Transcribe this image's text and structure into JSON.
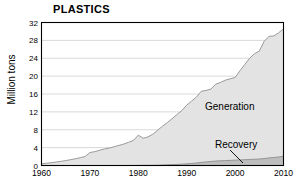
{
  "chart_data": {
    "type": "area",
    "title": "PLASTICS",
    "xlabel": "",
    "ylabel": "Million tons",
    "xlim": [
      1960,
      2010
    ],
    "ylim": [
      0,
      32
    ],
    "ytick_labels": [
      "0",
      "4",
      "8",
      "12",
      "16",
      "20",
      "24",
      "28",
      "32"
    ],
    "ytick_values": [
      0,
      4,
      8,
      12,
      16,
      20,
      24,
      28,
      32
    ],
    "xtick_labels": [
      "1960",
      "1970",
      "1980",
      "1990",
      "2000",
      "2010"
    ],
    "xtick_values": [
      1960,
      1970,
      1980,
      1990,
      2000,
      2010
    ],
    "grid": "horizontal",
    "legend": "inline-annotations",
    "colors": {
      "generation_fill": "#e3e3e3",
      "generation_line": "#9a9a9a",
      "recovery_fill": "#bdbdbd",
      "recovery_line": "#8c8c8c",
      "axis": "#000000",
      "gridline": "#d9d9d9",
      "text": "#000000"
    },
    "x": [
      1960,
      1961,
      1962,
      1963,
      1964,
      1965,
      1966,
      1967,
      1968,
      1969,
      1970,
      1971,
      1972,
      1973,
      1974,
      1975,
      1976,
      1977,
      1978,
      1979,
      1980,
      1981,
      1982,
      1983,
      1984,
      1985,
      1986,
      1987,
      1988,
      1989,
      1990,
      1991,
      1992,
      1993,
      1994,
      1995,
      1996,
      1997,
      1998,
      1999,
      2000,
      2001,
      2002,
      2003,
      2004,
      2005,
      2006,
      2007,
      2008,
      2009,
      2010
    ],
    "series": [
      {
        "name": "Generation",
        "label_text": "Generation",
        "values": [
          0.39,
          0.5,
          0.62,
          0.76,
          0.92,
          1.1,
          1.3,
          1.5,
          1.75,
          2.0,
          2.9,
          3.1,
          3.4,
          3.7,
          3.9,
          4.2,
          4.5,
          4.8,
          5.2,
          5.6,
          6.8,
          6.1,
          6.4,
          7.0,
          7.9,
          8.8,
          9.6,
          10.5,
          11.4,
          12.3,
          13.5,
          14.4,
          15.3,
          16.6,
          16.8,
          17.1,
          18.2,
          18.6,
          19.1,
          19.4,
          19.7,
          21.2,
          22.6,
          24.0,
          25.0,
          25.6,
          27.8,
          28.9,
          29.0,
          29.7,
          30.6
        ]
      },
      {
        "name": "Recovery",
        "label_text": "Recovery",
        "values": [
          0,
          0,
          0,
          0,
          0,
          0,
          0,
          0,
          0,
          0,
          0,
          0,
          0,
          0,
          0,
          0,
          0,
          0,
          0,
          0,
          0.02,
          0.03,
          0.04,
          0.05,
          0.06,
          0.12,
          0.16,
          0.2,
          0.24,
          0.3,
          0.37,
          0.45,
          0.55,
          0.7,
          0.8,
          0.9,
          1.0,
          1.05,
          1.1,
          1.15,
          1.2,
          1.25,
          1.3,
          1.35,
          1.4,
          1.45,
          1.55,
          1.7,
          1.8,
          1.9,
          2.1
        ]
      }
    ],
    "annotations": [
      {
        "text": "Generation",
        "x_px": 205,
        "y_px": 101
      },
      {
        "text": "Recovery",
        "x_px": 215,
        "y_px": 139,
        "leader_line": true
      }
    ]
  }
}
